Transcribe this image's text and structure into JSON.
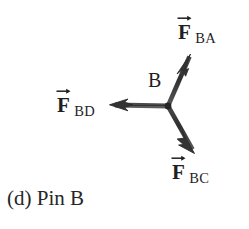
{
  "figure": {
    "caption": "(d) Pin B",
    "node_label": "B",
    "background_color": "#ffffff",
    "ink_color": "#3a3a3a",
    "text_color": "#1f1f1f",
    "vectors": [
      {
        "id": "fba",
        "symbol": "F",
        "subscript": "BA",
        "label_text": "F BA",
        "direction": "up-right",
        "origin": [
          168,
          106
        ],
        "tip": [
          190,
          55
        ],
        "angle_deg": 66,
        "arrow_name": "force-vector-fba"
      },
      {
        "id": "fbd",
        "symbol": "F",
        "subscript": "BD",
        "label_text": "F BD",
        "direction": "left",
        "origin": [
          168,
          106
        ],
        "tip": [
          110,
          105
        ],
        "angle_deg": 180,
        "arrow_name": "force-vector-fbd"
      },
      {
        "id": "fbc",
        "symbol": "F",
        "subscript": "BC",
        "label_text": "F BC",
        "direction": "down-right",
        "origin": [
          168,
          106
        ],
        "tip": [
          194,
          152
        ],
        "angle_deg": -61,
        "arrow_name": "force-vector-fbc"
      }
    ]
  }
}
